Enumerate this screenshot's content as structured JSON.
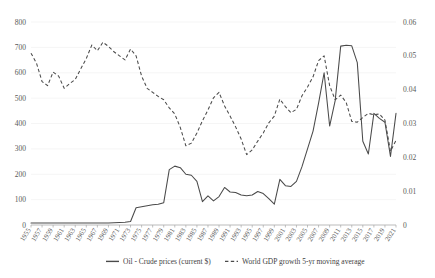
{
  "chart_data": {
    "type": "line",
    "title": "",
    "xlabel": "",
    "ylabel": "",
    "y2label": "",
    "grid": true,
    "legend_position": "bottom",
    "x": [
      1955,
      1956,
      1957,
      1958,
      1959,
      1960,
      1961,
      1962,
      1963,
      1964,
      1965,
      1966,
      1967,
      1968,
      1969,
      1970,
      1971,
      1972,
      1973,
      1974,
      1975,
      1976,
      1977,
      1978,
      1979,
      1980,
      1981,
      1982,
      1983,
      1984,
      1985,
      1986,
      1987,
      1988,
      1989,
      1990,
      1991,
      1992,
      1993,
      1994,
      1995,
      1996,
      1997,
      1998,
      1999,
      2000,
      2001,
      2002,
      2003,
      2004,
      2005,
      2006,
      2007,
      2008,
      2009,
      2010,
      2011,
      2012,
      2013,
      2014,
      2015,
      2016,
      2017,
      2018,
      2019,
      2020,
      2021
    ],
    "xtick_labels": [
      "1955",
      "1957",
      "1959",
      "1961",
      "1963",
      "1965",
      "1967",
      "1969",
      "1971",
      "1973",
      "1975",
      "1977",
      "1979",
      "1981",
      "1983",
      "1985",
      "1987",
      "1989",
      "1991",
      "1993",
      "1995",
      "1997",
      "1999",
      "2001",
      "2003",
      "2005",
      "2007",
      "2009",
      "2011",
      "2013",
      "2015",
      "2017",
      "2019",
      "2021"
    ],
    "ytick_labels": [
      "0",
      "100",
      "200",
      "300",
      "400",
      "500",
      "600",
      "700",
      "800"
    ],
    "y2tick_labels": [
      "0",
      "0.01",
      "0.02",
      "0.03",
      "0.04",
      "0.05",
      "0.06"
    ],
    "ylim": [
      0,
      800
    ],
    "y2lim": [
      0,
      0.06
    ],
    "xlim": [
      1955,
      2021
    ],
    "series": [
      {
        "name": "Oil - Crude prices (current $)",
        "axis": "left",
        "style": "solid",
        "color": "#4a4a4a",
        "values": [
          8,
          8,
          8,
          8,
          8,
          8,
          8,
          8,
          8,
          8,
          8,
          8,
          8,
          8,
          8,
          9,
          10,
          11,
          14,
          68,
          72,
          76,
          80,
          82,
          88,
          218,
          232,
          226,
          200,
          196,
          172,
          92,
          115,
          95,
          112,
          148,
          130,
          128,
          118,
          115,
          118,
          132,
          124,
          104,
          82,
          180,
          155,
          152,
          172,
          230,
          300,
          370,
          480,
          600,
          390,
          490,
          705,
          708,
          706,
          640,
          330,
          280,
          440,
          420,
          405,
          270,
          440
        ]
      },
      {
        "name": "World GDP growth 5-yr moving average",
        "axis": "right",
        "style": "dashed",
        "color": "#4a4a4a",
        "values": [
          0.0508,
          0.0478,
          0.0424,
          0.0412,
          0.0452,
          0.044,
          0.0404,
          0.0418,
          0.043,
          0.0462,
          0.0492,
          0.0532,
          0.0515,
          0.054,
          0.0528,
          0.0512,
          0.05,
          0.0488,
          0.052,
          0.05,
          0.044,
          0.0404,
          0.0392,
          0.038,
          0.037,
          0.0346,
          0.0328,
          0.0288,
          0.0234,
          0.0242,
          0.0272,
          0.0308,
          0.034,
          0.0376,
          0.0392,
          0.0352,
          0.0322,
          0.029,
          0.0254,
          0.0208,
          0.0222,
          0.0248,
          0.0272,
          0.0302,
          0.0322,
          0.0372,
          0.035,
          0.0332,
          0.0342,
          0.0382,
          0.0408,
          0.0438,
          0.0486,
          0.05,
          0.0412,
          0.037,
          0.0384,
          0.0362,
          0.0306,
          0.0304,
          0.0318,
          0.033,
          0.0326,
          0.0328,
          0.031,
          0.0218,
          0.025
        ]
      }
    ]
  },
  "legend": {
    "items": [
      {
        "label": "Oil - Crude prices (current $)",
        "style": "solid"
      },
      {
        "label": "World GDP growth 5-yr moving average",
        "style": "dashed"
      }
    ]
  }
}
